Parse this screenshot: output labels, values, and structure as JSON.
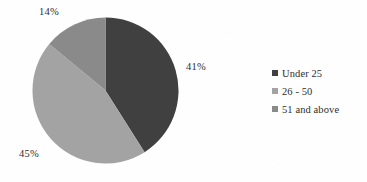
{
  "chart_data": {
    "type": "pie",
    "title": "",
    "categories": [
      "Under 25",
      "26 - 50",
      "51 and above"
    ],
    "values": [
      41,
      45,
      14
    ],
    "value_labels": [
      "41%",
      "45%",
      "14%"
    ],
    "colors": [
      "#404040",
      "#a3a3a3",
      "#8a8a8a"
    ],
    "legend_position": "right",
    "grid": false,
    "start_angle_deg": 0,
    "direction": "clockwise",
    "slices": [
      {
        "label": "Under 25",
        "value": 41,
        "display": "41%",
        "color": "#404040",
        "label_x": 186,
        "label_y": 61
      },
      {
        "label": "26 - 50",
        "value": 45,
        "display": "45%",
        "color": "#a3a3a3",
        "label_x": 19,
        "label_y": 148
      },
      {
        "label": "51 and above",
        "value": 14,
        "display": "14%",
        "color": "#8a8a8a",
        "label_x": 39,
        "label_y": 6
      }
    ]
  },
  "legend": {
    "items": [
      {
        "label": "Under 25",
        "color": "#404040"
      },
      {
        "label": "26 - 50",
        "color": "#a3a3a3"
      },
      {
        "label": "51 and above",
        "color": "#8a8a8a"
      }
    ]
  },
  "canvas": {
    "background": "#fefefe",
    "text_color": "#2e2e2e"
  }
}
